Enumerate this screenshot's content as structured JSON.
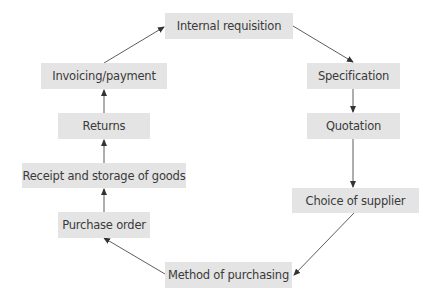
{
  "diagram": {
    "nodes": [
      {
        "id": "internal_requisition",
        "label": "Internal requisition"
      },
      {
        "id": "specification",
        "label": "Specification"
      },
      {
        "id": "quotation",
        "label": "Quotation"
      },
      {
        "id": "choice_of_supplier",
        "label": "Choice of supplier"
      },
      {
        "id": "method_of_purchasing",
        "label": "Method of purchasing"
      },
      {
        "id": "purchase_order",
        "label": "Purchase order"
      },
      {
        "id": "receipt_and_storage",
        "label": "Receipt and storage of goods"
      },
      {
        "id": "returns",
        "label": "Returns"
      },
      {
        "id": "invoicing_payment",
        "label": "Invoicing/payment"
      }
    ],
    "edges": [
      {
        "from": "internal_requisition",
        "to": "specification"
      },
      {
        "from": "specification",
        "to": "quotation"
      },
      {
        "from": "quotation",
        "to": "choice_of_supplier"
      },
      {
        "from": "choice_of_supplier",
        "to": "method_of_purchasing"
      },
      {
        "from": "method_of_purchasing",
        "to": "purchase_order"
      },
      {
        "from": "purchase_order",
        "to": "receipt_and_storage"
      },
      {
        "from": "receipt_and_storage",
        "to": "returns"
      },
      {
        "from": "returns",
        "to": "invoicing_payment"
      },
      {
        "from": "invoicing_payment",
        "to": "internal_requisition"
      }
    ],
    "colors": {
      "node_fill": "#e4e4e4",
      "node_text": "#3a3a3a",
      "edge": "#333333"
    }
  }
}
